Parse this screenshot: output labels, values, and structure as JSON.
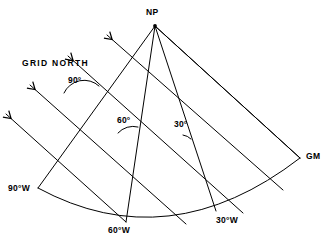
{
  "figure": {
    "type": "cartographic-projection-diagram",
    "stroke_color": "#000000",
    "background_color": "#ffffff"
  },
  "labels": {
    "pole": "NP",
    "grid_north": "GRID NORTH",
    "greenwich_meridian": "GM"
  },
  "angles": [
    {
      "id": "angle-90",
      "text": "90°",
      "value": 90,
      "x": 68,
      "y": 76
    },
    {
      "id": "angle-60",
      "text": "60°",
      "value": 60,
      "x": 117,
      "y": 116
    },
    {
      "id": "angle-30",
      "text": "30°",
      "value": 30,
      "x": 174,
      "y": 120
    }
  ],
  "meridian_labels": [
    {
      "id": "meridian-90w",
      "text": "90°W",
      "longitude": -90,
      "x": 8,
      "y": 184
    },
    {
      "id": "meridian-60w",
      "text": "60°W",
      "longitude": -60,
      "x": 108,
      "y": 226
    },
    {
      "id": "meridian-30w",
      "text": "30°W",
      "longitude": -30,
      "x": 216,
      "y": 216
    }
  ],
  "point_labels": [
    {
      "id": "pole-label",
      "text": "NP",
      "x": 146,
      "y": 8
    },
    {
      "id": "gm-label",
      "text": "GM",
      "x": 306,
      "y": 152
    }
  ],
  "grid_north_label": {
    "text": "GRID NORTH",
    "x": 22,
    "y": 59
  },
  "geometry": {
    "pole": {
      "x": 155,
      "y": 26
    },
    "meridians": [
      {
        "id": "meridian-line-90w",
        "from": [
          155,
          26
        ],
        "to": [
          38,
          188
        ]
      },
      {
        "id": "meridian-line-60w",
        "from": [
          155,
          26
        ],
        "to": [
          126,
          222
        ]
      },
      {
        "id": "meridian-line-30w",
        "from": [
          155,
          26
        ],
        "to": [
          216,
          211
        ]
      },
      {
        "id": "meridian-line-gm",
        "from": [
          155,
          26
        ],
        "to": [
          300,
          158
        ]
      }
    ],
    "parallel_arc": {
      "from": [
        38,
        188
      ],
      "to": [
        300,
        158
      ],
      "sagitta": 46
    },
    "grid_lines": [
      {
        "id": "grid-line-1",
        "from": [
          300,
          158
        ],
        "to": [
          155,
          26
        ],
        "arrow": false
      },
      {
        "id": "grid-line-2",
        "from": [
          283,
          190
        ],
        "to": [
          107,
          35
        ],
        "arrow": true
      },
      {
        "id": "grid-line-3",
        "from": [
          243,
          213
        ],
        "to": [
          68,
          56
        ],
        "arrow": true
      },
      {
        "id": "grid-line-4",
        "from": [
          186,
          224
        ],
        "to": [
          30,
          85
        ],
        "arrow": true
      },
      {
        "id": "grid-line-5",
        "from": [
          126,
          222
        ],
        "to": [
          6,
          114
        ],
        "arrow": true
      }
    ]
  }
}
